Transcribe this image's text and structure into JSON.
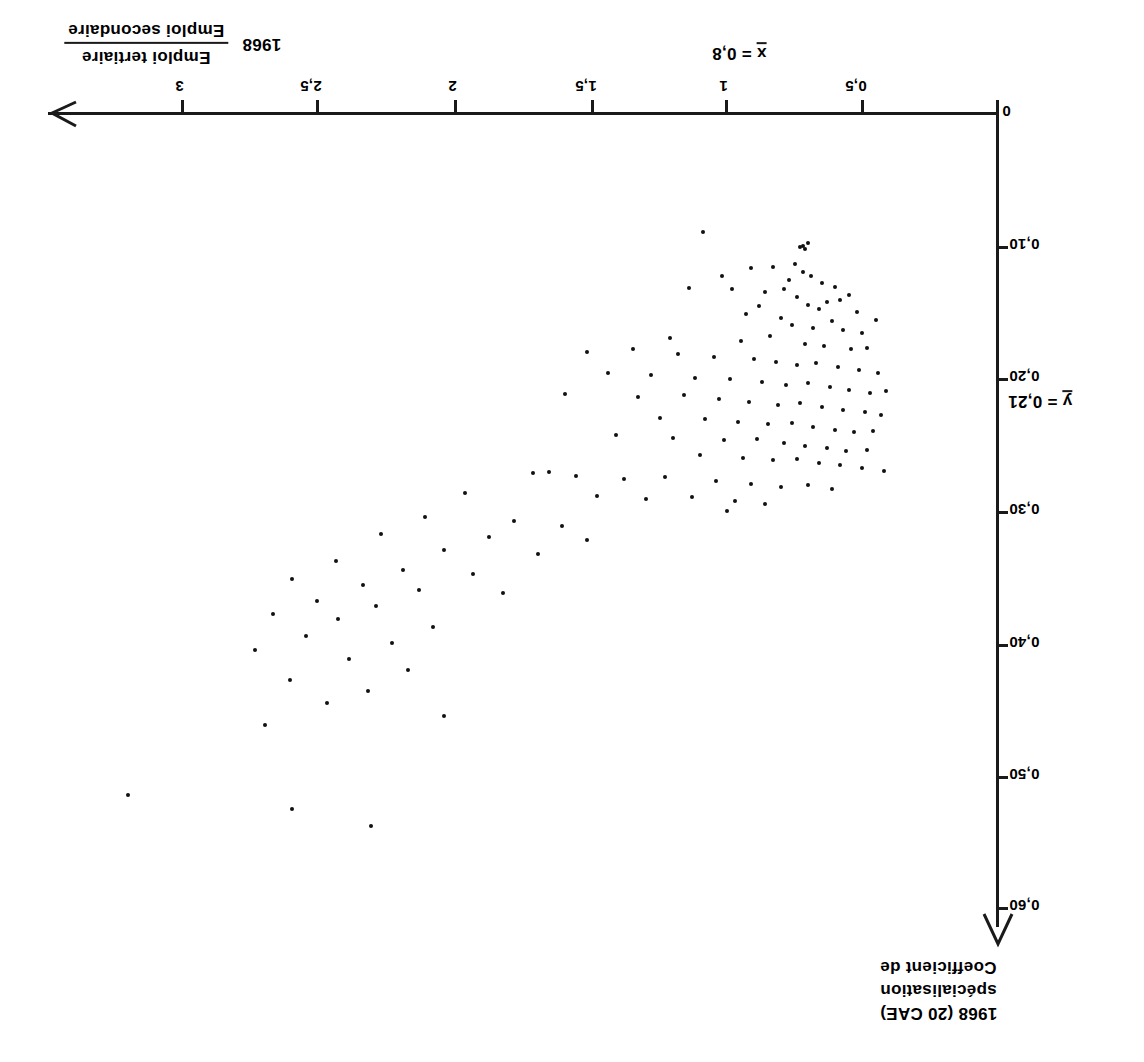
{
  "figure": {
    "orientation": "rotated-180",
    "background": "#ffffff",
    "ink": "#1a1a1a"
  },
  "x_axis": {
    "title_numerator": "Emploi tertiaire",
    "title_denominator": "Emploi secondaire",
    "title_year": "1968",
    "ticks": [
      "0",
      "0,5",
      "1",
      "1,5",
      "2",
      "2,5",
      "3"
    ],
    "mean_label": "x = 0,8",
    "mean_symbol": "x",
    "mean_value_text": "= 0,8"
  },
  "y_axis": {
    "title_line1": "Coefficient de",
    "title_line2": "spécialisation",
    "title_line3": "1968  (20 CAE)",
    "ticks": [
      "0",
      "0,10",
      "0,20",
      "0,30",
      "0,40",
      "0,50",
      "0,60"
    ],
    "mean_label": "y = 0,21",
    "mean_symbol": "y",
    "mean_value_text": "= 0,21"
  },
  "chart_data": {
    "type": "scatter",
    "title": "",
    "xlabel": "Emploi tertiaire / Emploi secondaire 1968",
    "ylabel": "Coefficient de spécialisation 1968 (20 CAE)",
    "xlim": [
      0,
      3.2
    ],
    "ylim": [
      0,
      0.62
    ],
    "x_ticks": [
      0,
      0.5,
      1,
      1.5,
      2,
      2.5,
      3
    ],
    "x_tick_labels": [
      "0",
      "0,5",
      "1",
      "1,5",
      "2",
      "2,5",
      "3"
    ],
    "y_ticks": [
      0,
      0.1,
      0.2,
      0.3,
      0.4,
      0.5,
      0.6
    ],
    "y_tick_labels": [
      "0",
      "0,10",
      "0,20",
      "0,30",
      "0,40",
      "0,50",
      "0,60"
    ],
    "grid": false,
    "legend": null,
    "x_mean": 0.8,
    "y_mean": 0.21,
    "annotations": [
      {
        "text": "x = 0,8",
        "axis": "x"
      },
      {
        "text": "y = 0,21",
        "axis": "y"
      }
    ],
    "n_points": 148,
    "points": [
      [
        1.09,
        0.09
      ],
      [
        0.72,
        0.1
      ],
      [
        0.7,
        0.098
      ],
      [
        0.71,
        0.103
      ],
      [
        0.73,
        0.101
      ],
      [
        0.91,
        0.117
      ],
      [
        1.02,
        0.123
      ],
      [
        0.83,
        0.116
      ],
      [
        0.75,
        0.114
      ],
      [
        0.72,
        0.12
      ],
      [
        0.69,
        0.123
      ],
      [
        0.77,
        0.126
      ],
      [
        0.65,
        0.128
      ],
      [
        0.6,
        0.131
      ],
      [
        1.14,
        0.132
      ],
      [
        0.98,
        0.133
      ],
      [
        0.86,
        0.135
      ],
      [
        0.79,
        0.133
      ],
      [
        0.55,
        0.137
      ],
      [
        0.74,
        0.139
      ],
      [
        0.58,
        0.141
      ],
      [
        0.63,
        0.143
      ],
      [
        0.88,
        0.146
      ],
      [
        0.7,
        0.145
      ],
      [
        0.66,
        0.148
      ],
      [
        0.52,
        0.15
      ],
      [
        0.93,
        0.152
      ],
      [
        0.8,
        0.155
      ],
      [
        0.61,
        0.157
      ],
      [
        0.45,
        0.156
      ],
      [
        0.76,
        0.16
      ],
      [
        0.68,
        0.162
      ],
      [
        0.57,
        0.164
      ],
      [
        0.5,
        0.166
      ],
      [
        0.84,
        0.168
      ],
      [
        1.21,
        0.17
      ],
      [
        0.95,
        0.172
      ],
      [
        0.71,
        0.174
      ],
      [
        0.64,
        0.176
      ],
      [
        0.54,
        0.178
      ],
      [
        0.48,
        0.177
      ],
      [
        1.35,
        0.178
      ],
      [
        1.52,
        0.18
      ],
      [
        1.18,
        0.182
      ],
      [
        1.05,
        0.184
      ],
      [
        0.9,
        0.186
      ],
      [
        0.82,
        0.188
      ],
      [
        0.74,
        0.19
      ],
      [
        0.67,
        0.189
      ],
      [
        0.59,
        0.192
      ],
      [
        0.51,
        0.194
      ],
      [
        0.44,
        0.196
      ],
      [
        1.44,
        0.196
      ],
      [
        1.28,
        0.198
      ],
      [
        1.12,
        0.2
      ],
      [
        0.99,
        0.201
      ],
      [
        0.87,
        0.203
      ],
      [
        0.78,
        0.205
      ],
      [
        0.7,
        0.204
      ],
      [
        0.62,
        0.207
      ],
      [
        0.55,
        0.209
      ],
      [
        0.47,
        0.211
      ],
      [
        0.41,
        0.21
      ],
      [
        1.6,
        0.212
      ],
      [
        1.33,
        0.214
      ],
      [
        1.16,
        0.213
      ],
      [
        1.03,
        0.216
      ],
      [
        0.92,
        0.218
      ],
      [
        0.81,
        0.22
      ],
      [
        0.73,
        0.219
      ],
      [
        0.65,
        0.222
      ],
      [
        0.57,
        0.224
      ],
      [
        0.49,
        0.226
      ],
      [
        0.43,
        0.228
      ],
      [
        1.25,
        0.23
      ],
      [
        1.08,
        0.231
      ],
      [
        0.96,
        0.233
      ],
      [
        0.85,
        0.235
      ],
      [
        0.76,
        0.234
      ],
      [
        0.68,
        0.237
      ],
      [
        0.6,
        0.239
      ],
      [
        0.53,
        0.241
      ],
      [
        0.46,
        0.24
      ],
      [
        1.41,
        0.243
      ],
      [
        1.2,
        0.245
      ],
      [
        1.01,
        0.247
      ],
      [
        0.89,
        0.246
      ],
      [
        0.79,
        0.249
      ],
      [
        0.71,
        0.251
      ],
      [
        0.63,
        0.253
      ],
      [
        0.56,
        0.255
      ],
      [
        0.48,
        0.254
      ],
      [
        1.1,
        0.258
      ],
      [
        0.94,
        0.26
      ],
      [
        0.83,
        0.262
      ],
      [
        0.74,
        0.261
      ],
      [
        0.66,
        0.264
      ],
      [
        0.58,
        0.266
      ],
      [
        0.5,
        0.268
      ],
      [
        0.42,
        0.27
      ],
      [
        1.72,
        0.272
      ],
      [
        1.66,
        0.271
      ],
      [
        1.56,
        0.274
      ],
      [
        1.38,
        0.276
      ],
      [
        1.23,
        0.275
      ],
      [
        1.04,
        0.278
      ],
      [
        0.91,
        0.28
      ],
      [
        0.8,
        0.282
      ],
      [
        0.7,
        0.281
      ],
      [
        0.61,
        0.284
      ],
      [
        1.97,
        0.287
      ],
      [
        1.48,
        0.289
      ],
      [
        1.3,
        0.291
      ],
      [
        1.13,
        0.29
      ],
      [
        0.97,
        0.293
      ],
      [
        0.86,
        0.295
      ],
      [
        1.0,
        0.3
      ],
      [
        2.12,
        0.305
      ],
      [
        1.79,
        0.308
      ],
      [
        1.61,
        0.312
      ],
      [
        2.28,
        0.318
      ],
      [
        1.88,
        0.32
      ],
      [
        1.52,
        0.322
      ],
      [
        2.05,
        0.33
      ],
      [
        1.7,
        0.333
      ],
      [
        2.45,
        0.338
      ],
      [
        2.2,
        0.345
      ],
      [
        1.94,
        0.348
      ],
      [
        2.61,
        0.352
      ],
      [
        2.35,
        0.356
      ],
      [
        2.14,
        0.36
      ],
      [
        1.83,
        0.362
      ],
      [
        2.52,
        0.368
      ],
      [
        2.3,
        0.372
      ],
      [
        2.68,
        0.378
      ],
      [
        2.44,
        0.382
      ],
      [
        2.09,
        0.388
      ],
      [
        2.56,
        0.395
      ],
      [
        2.24,
        0.4
      ],
      [
        2.75,
        0.405
      ],
      [
        2.4,
        0.412
      ],
      [
        2.18,
        0.42
      ],
      [
        2.62,
        0.428
      ],
      [
        2.33,
        0.436
      ],
      [
        2.48,
        0.445
      ],
      [
        2.05,
        0.455
      ],
      [
        2.71,
        0.462
      ],
      [
        3.22,
        0.515
      ],
      [
        2.61,
        0.525
      ],
      [
        2.32,
        0.538
      ]
    ]
  }
}
